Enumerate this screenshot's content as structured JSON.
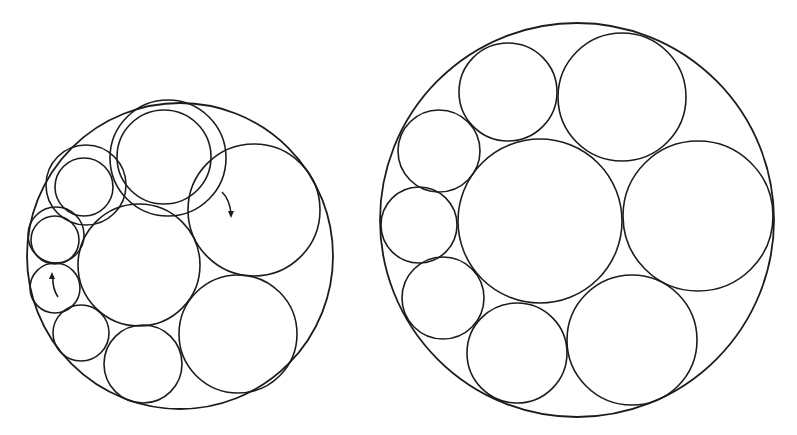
{
  "figure": {
    "background": "#ffffff",
    "stroke_color": "#1c1c1c"
  },
  "left_packing": {
    "outer": {
      "cx": 180,
      "cy": 256,
      "r": 153
    },
    "circles": [
      {
        "id": "upper-middle-outer",
        "cx": 168,
        "cy": 158,
        "r": 58
      },
      {
        "id": "upper-middle-inner",
        "cx": 164,
        "cy": 157,
        "r": 47
      },
      {
        "id": "upper-left-outer",
        "cx": 86,
        "cy": 185,
        "r": 40
      },
      {
        "id": "upper-left-inner",
        "cx": 84,
        "cy": 187,
        "r": 29
      },
      {
        "id": "left-outer",
        "cx": 56,
        "cy": 235,
        "r": 28
      },
      {
        "id": "left-inner",
        "cx": 55,
        "cy": 240,
        "r": 24
      },
      {
        "id": "left-lower",
        "cx": 55,
        "cy": 288,
        "r": 25
      },
      {
        "id": "lower-left",
        "cx": 81,
        "cy": 333,
        "r": 28
      },
      {
        "id": "bottom-middle",
        "cx": 143,
        "cy": 364,
        "r": 39
      },
      {
        "id": "bottom-right",
        "cx": 238,
        "cy": 334,
        "r": 59
      },
      {
        "id": "right-upper",
        "cx": 254,
        "cy": 210,
        "r": 66
      },
      {
        "id": "center",
        "cx": 139,
        "cy": 265,
        "r": 61
      }
    ],
    "arrows": [
      {
        "id": "arrow-right",
        "path": "M222,192 Q230,200 231,214",
        "head": [
          231,
          218
        ],
        "direction": "down"
      },
      {
        "id": "arrow-left",
        "path": "M58,297 Q52,288 53,276",
        "head": [
          52,
          272
        ],
        "direction": "up"
      }
    ]
  },
  "right_packing": {
    "outer": {
      "cx": 577,
      "cy": 220,
      "r": 197
    },
    "circles": [
      {
        "id": "top-left",
        "cx": 508,
        "cy": 92,
        "r": 49
      },
      {
        "id": "top-right",
        "cx": 622,
        "cy": 97,
        "r": 64
      },
      {
        "id": "left-upper",
        "cx": 439,
        "cy": 151,
        "r": 41
      },
      {
        "id": "left-middle",
        "cx": 419,
        "cy": 225,
        "r": 38
      },
      {
        "id": "left-lower",
        "cx": 443,
        "cy": 298,
        "r": 41
      },
      {
        "id": "bottom",
        "cx": 517,
        "cy": 353,
        "r": 50
      },
      {
        "id": "bottom-right",
        "cx": 632,
        "cy": 340,
        "r": 65
      },
      {
        "id": "right",
        "cx": 698,
        "cy": 216,
        "r": 75
      },
      {
        "id": "center",
        "cx": 540,
        "cy": 221,
        "r": 82
      }
    ]
  }
}
